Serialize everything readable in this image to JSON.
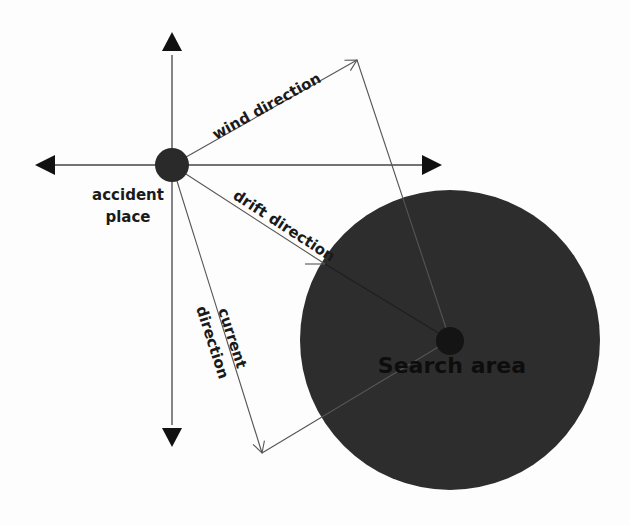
{
  "diagram": {
    "title": "",
    "labels": {
      "wind": "wind direction",
      "drift": "drift direction",
      "current_line1": "current",
      "current_line2": "direction",
      "accident_line1": "accident",
      "accident_line2": "place",
      "search": "Search area"
    },
    "colors": {
      "background": "#fdfdfd",
      "search_area_fill": "#2d2d2d",
      "point_fill": "#2a2a2a",
      "arrowhead": "#111111",
      "text": "#1a1a1a",
      "line": "#555555"
    },
    "nodes": [
      {
        "id": "accident-place",
        "label": "accident place"
      },
      {
        "id": "search-area",
        "label": "Search area"
      }
    ],
    "edges": [
      {
        "from": "accident-place",
        "to": "wind-endpoint",
        "label": "wind direction"
      },
      {
        "from": "accident-place",
        "to": "current-endpoint",
        "label": "current direction"
      },
      {
        "from": "accident-place",
        "to": "search-area",
        "label": "drift direction"
      },
      {
        "from": "wind-endpoint",
        "to": "search-area",
        "label": ""
      },
      {
        "from": "current-endpoint",
        "to": "search-area",
        "label": ""
      }
    ],
    "compass_axes": [
      "north",
      "south",
      "east",
      "west"
    ]
  }
}
